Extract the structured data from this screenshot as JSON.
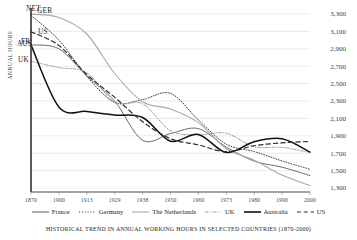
{
  "chart_data": {
    "type": "line",
    "title": "",
    "caption": "Historical trend in annual working hours in selected countries (1870-2000)",
    "xlabel": "",
    "ylabel": "Annual hours",
    "x": [
      1870,
      1900,
      1913,
      1929,
      1938,
      1950,
      1960,
      1973,
      1980,
      1990,
      2000
    ],
    "xticklabels": [
      "1870",
      "1900",
      "1913",
      "1929",
      "1938",
      "1950",
      "1960",
      "1973",
      "1980",
      "1990",
      "2000"
    ],
    "ylim": [
      1300,
      3300
    ],
    "yticks": [
      1300,
      1500,
      1700,
      1900,
      2100,
      2300,
      2500,
      2700,
      2900,
      3100,
      3300
    ],
    "yticklabels": [
      "1,300",
      "1,500",
      "1,700",
      "1,900",
      "2,100",
      "2,300",
      "2,500",
      "2,700",
      "2,900",
      "3,100",
      "3,300"
    ],
    "grid": true,
    "legend_position": "bottom",
    "series": [
      {
        "name": "France",
        "tag": "FR",
        "style": "solid",
        "color": "#6d6d6d",
        "width": 1.0,
        "values": [
          2945,
          2900,
          2588,
          2297,
          1848,
          1926,
          1983,
          1771,
          1609,
          1539,
          1443
        ]
      },
      {
        "name": "Germany",
        "tag": "GER",
        "style": "dotted",
        "color": "#3a3a3a",
        "width": 1.0,
        "values": [
          3284,
          3000,
          2584,
          2284,
          2316,
          2387,
          2081,
          1804,
          1719,
          1611,
          1515
        ]
      },
      {
        "name": "The Netherlands",
        "tag": "NET",
        "style": "solid",
        "color": "#a9a9a9",
        "width": 1.1,
        "values": [
          3299,
          3260,
          3070,
          2616,
          2292,
          2208,
          2051,
          1751,
          1620,
          1448,
          1327
        ]
      },
      {
        "name": "UK",
        "tag": "UK",
        "style": "dashdot",
        "color": "#9a9a9a",
        "width": 0.95,
        "values": [
          2755,
          2685,
          2624,
          2286,
          2267,
          1958,
          1913,
          1929,
          1775,
          1767,
          1708
        ]
      },
      {
        "name": "Australia",
        "tag": "AUS",
        "style": "solid",
        "color": "#111111",
        "width": 1.5,
        "values": [
          2945,
          2230,
          2180,
          2139,
          2110,
          1838,
          1916,
          1708,
          1832,
          1866,
          1713
        ]
      },
      {
        "name": "US",
        "tag": "US",
        "style": "dashed",
        "color": "#2e2e2e",
        "width": 1.2,
        "values": [
          3096,
          2938,
          2605,
          2342,
          2062,
          1867,
          1795,
          1717,
          1786,
          1819,
          1835
        ]
      }
    ]
  },
  "legend": {
    "items": [
      {
        "label": "France",
        "style": "solid",
        "color": "#6d6d6d"
      },
      {
        "label": "Germany",
        "style": "dotted",
        "color": "#3a3a3a"
      },
      {
        "label": "The Netherlands",
        "style": "solid",
        "color": "#a9a9a9"
      },
      {
        "label": "UK",
        "style": "dashdot",
        "color": "#9a9a9a"
      },
      {
        "label": "Australia",
        "style": "solid",
        "color": "#111111"
      },
      {
        "label": "US",
        "style": "dashed",
        "color": "#2e2e2e"
      }
    ]
  }
}
